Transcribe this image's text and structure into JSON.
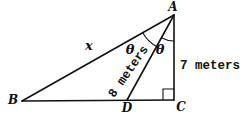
{
  "diagram": {
    "background_color": "#ffffff",
    "line_color": "#111111",
    "vertices": {
      "a": "A",
      "b": "B",
      "c": "C",
      "d": "D"
    },
    "side_labels": {
      "ba_hypotenuse": "x",
      "ad_cevian": "8 meters",
      "ac_vertical": "7 meters"
    },
    "angle_labels": {
      "bad": "θ",
      "dac": "θ"
    },
    "markers": {
      "right_angle_at": "C"
    }
  }
}
